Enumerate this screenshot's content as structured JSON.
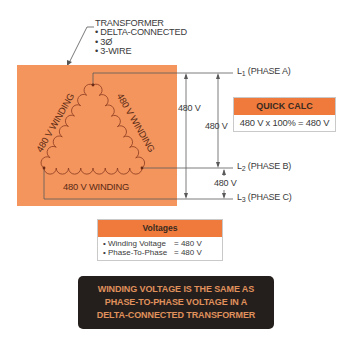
{
  "callout": {
    "title": "TRANSFORMER",
    "bullets": [
      "• DELTA-CONNECTED",
      "• 3Ø",
      "• 3-WIRE"
    ]
  },
  "transformer": {
    "fill_color": "#f4955e",
    "windings": [
      {
        "label": "480 V WINDING",
        "side": "left"
      },
      {
        "label": "480 V WINDING",
        "side": "right"
      },
      {
        "label": "480 V WINDING",
        "side": "bottom"
      }
    ]
  },
  "lines": [
    {
      "name": "L",
      "sub": "1",
      "phase": "(PHASE A)"
    },
    {
      "name": "L",
      "sub": "2",
      "phase": "(PHASE B)"
    },
    {
      "name": "L",
      "sub": "3",
      "phase": "(PHASE C)"
    }
  ],
  "measurements": {
    "l1_l3": "480 V",
    "l1_l2": "480 V",
    "l2_l3": "480 V"
  },
  "quick_calc": {
    "title": "QUICK CALC",
    "formula": "480 V x 100% = 480 V"
  },
  "voltages": {
    "title": "Voltages",
    "rows": [
      {
        "label": "• Winding Voltage",
        "value": "= 480 V"
      },
      {
        "label": "• Phase-To-Phase",
        "value": "= 480 V"
      }
    ]
  },
  "note": {
    "lines": [
      "WINDING VOLTAGE IS THE SAME AS",
      "PHASE-TO-PHASE VOLTAGE IN A",
      "DELTA-CONNECTED TRANSFORMER"
    ],
    "text_color": "#e0915c",
    "bg_color": "#241f1d"
  },
  "colors": {
    "orange_header": "#f07a3c",
    "line": "#666666",
    "coil": "#8a3a1e"
  }
}
